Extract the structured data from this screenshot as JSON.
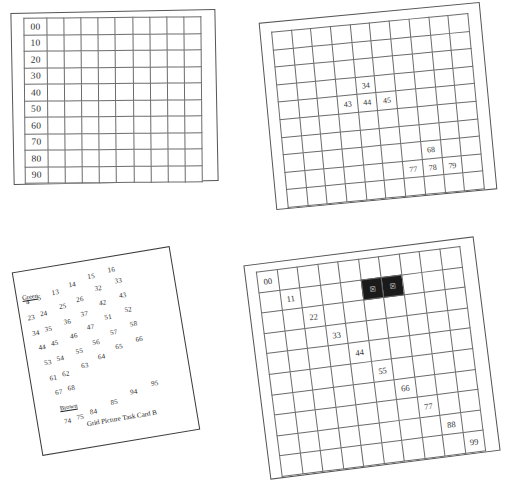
{
  "document": {
    "title": "Grid Picture Task Card B",
    "background_color": "#ffffff",
    "ink_color": "#2a2a2a",
    "grid_line_color": "#6b6b6b",
    "filled_cell_color": "#1a1a1a"
  },
  "panels": {
    "top_left_grid": {
      "name": "blank-hundred-grid-with-tens-labels",
      "rows": 10,
      "columns": 10,
      "row_labels": [
        "00",
        "10",
        "20",
        "30",
        "40",
        "50",
        "60",
        "70",
        "80",
        "90"
      ],
      "filled_cells": []
    },
    "top_right_grid": {
      "name": "partially-numbered-grid",
      "rows": 10,
      "columns": 10,
      "entries": [
        {
          "row": 4,
          "col": 5,
          "value": "34"
        },
        {
          "row": 5,
          "col": 4,
          "value": "43"
        },
        {
          "row": 5,
          "col": 5,
          "value": "44"
        },
        {
          "row": 5,
          "col": 6,
          "value": "45"
        },
        {
          "row": 8,
          "col": 8,
          "value": "68"
        },
        {
          "row": 9,
          "col": 7,
          "value": "77"
        },
        {
          "row": 9,
          "col": 8,
          "value": "78"
        },
        {
          "row": 9,
          "col": 9,
          "value": "79"
        }
      ]
    },
    "task_card": {
      "name": "grid-picture-task-card-b",
      "caption": "Grid Picture Task Card B",
      "groups": [
        {
          "label": "Green",
          "label_underlined": true
        },
        {
          "label": "Brown",
          "label_underlined": true
        }
      ],
      "numbers": [
        {
          "value": "4",
          "x": 8,
          "y": 27
        },
        {
          "value": "5",
          "x": 20,
          "y": 25
        },
        {
          "value": "13",
          "x": 35,
          "y": 22
        },
        {
          "value": "14",
          "x": 53,
          "y": 17
        },
        {
          "value": "15",
          "x": 73,
          "y": 12
        },
        {
          "value": "16",
          "x": 94,
          "y": 9
        },
        {
          "value": "23",
          "x": 7,
          "y": 43
        },
        {
          "value": "24",
          "x": 20,
          "y": 41
        },
        {
          "value": "25",
          "x": 40,
          "y": 37
        },
        {
          "value": "26",
          "x": 58,
          "y": 33
        },
        {
          "value": "32",
          "x": 78,
          "y": 25
        },
        {
          "value": "33",
          "x": 99,
          "y": 21
        },
        {
          "value": "34",
          "x": 9,
          "y": 59
        },
        {
          "value": "35",
          "x": 22,
          "y": 57
        },
        {
          "value": "36",
          "x": 42,
          "y": 53
        },
        {
          "value": "37",
          "x": 60,
          "y": 48
        },
        {
          "value": "42",
          "x": 80,
          "y": 40
        },
        {
          "value": "43",
          "x": 101,
          "y": 36
        },
        {
          "value": "44",
          "x": 13,
          "y": 74
        },
        {
          "value": "45",
          "x": 26,
          "y": 72
        },
        {
          "value": "46",
          "x": 46,
          "y": 68
        },
        {
          "value": "47",
          "x": 64,
          "y": 62
        },
        {
          "value": "51",
          "x": 83,
          "y": 55
        },
        {
          "value": "52",
          "x": 104,
          "y": 51
        },
        {
          "value": "53",
          "x": 16,
          "y": 90
        },
        {
          "value": "54",
          "x": 29,
          "y": 88
        },
        {
          "value": "55",
          "x": 49,
          "y": 84
        },
        {
          "value": "56",
          "x": 67,
          "y": 78
        },
        {
          "value": "57",
          "x": 86,
          "y": 71
        },
        {
          "value": "58",
          "x": 107,
          "y": 66
        },
        {
          "value": "61",
          "x": 19,
          "y": 106
        },
        {
          "value": "62",
          "x": 32,
          "y": 104
        },
        {
          "value": "63",
          "x": 52,
          "y": 99
        },
        {
          "value": "64",
          "x": 70,
          "y": 93
        },
        {
          "value": "65",
          "x": 89,
          "y": 86
        },
        {
          "value": "66",
          "x": 110,
          "y": 82
        },
        {
          "value": "67",
          "x": 22,
          "y": 121
        },
        {
          "value": "68",
          "x": 35,
          "y": 119
        },
        {
          "value": "74",
          "x": 26,
          "y": 151
        },
        {
          "value": "75",
          "x": 39,
          "y": 149
        },
        {
          "value": "84",
          "x": 53,
          "y": 146
        },
        {
          "value": "85",
          "x": 75,
          "y": 140
        },
        {
          "value": "94",
          "x": 96,
          "y": 133
        },
        {
          "value": "95",
          "x": 118,
          "y": 128
        }
      ],
      "label_positions": [
        {
          "text": "Green",
          "x": 5,
          "y": 22
        },
        {
          "text": "Brown",
          "x": 24,
          "y": 137
        }
      ],
      "caption_position": {
        "x": 48,
        "y": 157
      }
    },
    "bottom_right_grid": {
      "name": "diagonal-doubles-grid",
      "rows": 10,
      "columns": 10,
      "entries": [
        {
          "row": 1,
          "col": 1,
          "value": "00"
        },
        {
          "row": 2,
          "col": 2,
          "value": "11"
        },
        {
          "row": 3,
          "col": 3,
          "value": "22"
        },
        {
          "row": 4,
          "col": 4,
          "value": "33"
        },
        {
          "row": 5,
          "col": 5,
          "value": "44"
        },
        {
          "row": 6,
          "col": 6,
          "value": "55"
        },
        {
          "row": 7,
          "col": 7,
          "value": "66"
        },
        {
          "row": 8,
          "col": 8,
          "value": "77"
        },
        {
          "row": 9,
          "col": 9,
          "value": "88"
        },
        {
          "row": 10,
          "col": 10,
          "value": "99"
        }
      ],
      "filled_cells": [
        {
          "row": 2,
          "col": 6,
          "mark": "scribble"
        },
        {
          "row": 2,
          "col": 7,
          "mark": "scribble"
        }
      ]
    }
  }
}
